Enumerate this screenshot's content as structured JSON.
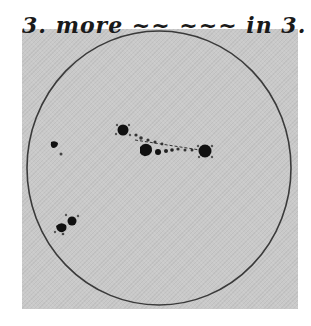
{
  "caption": {
    "text": "3. more ~~ ~~~ in 3."
  },
  "drawing": {
    "subject": "solar disk with sunspots",
    "paper_color": "#c9c9c9",
    "ink_color": "#1a1a1a",
    "disk": {
      "cx": 159,
      "cy": 168,
      "rx": 132,
      "ry": 137
    },
    "sunspots": [
      {
        "name": "upper-left-spot",
        "x": 123,
        "y": 130,
        "r": 6
      },
      {
        "name": "center-spot",
        "x": 147,
        "y": 150,
        "r": 6
      },
      {
        "name": "right-large-spot",
        "x": 205,
        "y": 151,
        "r": 7
      },
      {
        "name": "far-left-spot",
        "x": 54,
        "y": 145,
        "r": 4
      },
      {
        "name": "lower-left-spot-a",
        "x": 61,
        "y": 228,
        "r": 5
      },
      {
        "name": "lower-left-spot-b",
        "x": 72,
        "y": 221,
        "r": 5
      }
    ]
  }
}
